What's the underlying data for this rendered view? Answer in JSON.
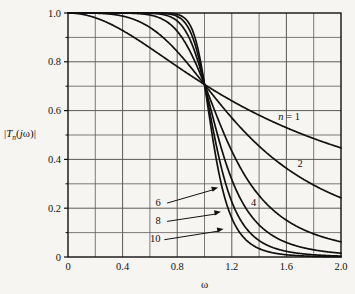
{
  "figure": {
    "background_color": "#f7f5f1",
    "ink_color": "#111111",
    "grid_color": "#5a5a5a",
    "axis_color": "#111111"
  },
  "labels": {
    "ylabel_prefix": "|",
    "ylabel_T": "T",
    "ylabel_n": "n",
    "ylabel_open": "(",
    "ylabel_j": "j",
    "ylabel_omega": "ω",
    "ylabel_close": ")|",
    "xlabel": "ω",
    "n_equals_one": "n = 1",
    "n_equals_one_italic": "n",
    "n_equals_one_rest": " = 1"
  },
  "chart_data": {
    "type": "line",
    "title": "",
    "subtitle": "",
    "xlabel": "ω",
    "ylabel": "|T_n(jω)|",
    "xlim": [
      0,
      2.0
    ],
    "ylim": [
      0,
      1.0
    ],
    "grid": true,
    "grid_x_major": [
      0,
      0.4,
      0.8,
      1.2,
      1.6,
      2.0
    ],
    "grid_x_minor": [
      0.2,
      0.6,
      1.0,
      1.4,
      1.8
    ],
    "grid_y_major": [
      0,
      0.2,
      0.4,
      0.6,
      0.8,
      1.0
    ],
    "grid_y_minor": [
      0.1,
      0.3,
      0.5,
      0.7,
      0.9
    ],
    "xticks": [
      0,
      0.4,
      0.8,
      1.2,
      1.6,
      2.0
    ],
    "xticklabels": [
      "0",
      "0.4",
      "0.8",
      "1.2",
      "1.6",
      "2.0"
    ],
    "yticks": [
      0,
      0.2,
      0.4,
      0.6,
      0.8,
      1.0
    ],
    "yticklabels": [
      "0",
      "0.2",
      "0.4",
      "0.6",
      "0.8",
      "1.0"
    ],
    "legend_position": "inline-annotations",
    "formula": "|T_n(jω)| = 1 / sqrt(1 + ω^(2n))",
    "crossing_point": [
      1.0,
      0.707
    ],
    "series": [
      {
        "name": "n = 1",
        "n": 1,
        "label": "n = 1",
        "label_x": 1.62,
        "label_y": 0.575,
        "annotation_style": "inline",
        "x": [
          0,
          0.1,
          0.2,
          0.3,
          0.4,
          0.5,
          0.6,
          0.7,
          0.8,
          0.9,
          1.0,
          1.1,
          1.2,
          1.3,
          1.4,
          1.5,
          1.6,
          1.7,
          1.8,
          1.9,
          2.0
        ],
        "values": [
          1.0,
          0.995,
          0.981,
          0.958,
          0.928,
          0.894,
          0.857,
          0.819,
          0.781,
          0.743,
          0.707,
          0.673,
          0.64,
          0.61,
          0.581,
          0.555,
          0.53,
          0.507,
          0.486,
          0.466,
          0.447
        ]
      },
      {
        "name": "2",
        "n": 2,
        "label": "2",
        "label_x": 1.7,
        "label_y": 0.385,
        "annotation_style": "inline",
        "x": [
          0,
          0.1,
          0.2,
          0.3,
          0.4,
          0.5,
          0.6,
          0.7,
          0.8,
          0.9,
          1.0,
          1.1,
          1.2,
          1.3,
          1.4,
          1.5,
          1.6,
          1.7,
          1.8,
          1.9,
          2.0
        ],
        "values": [
          1.0,
          1.0,
          0.999,
          0.996,
          0.987,
          0.97,
          0.941,
          0.899,
          0.843,
          0.779,
          0.707,
          0.637,
          0.571,
          0.511,
          0.459,
          0.413,
          0.372,
          0.337,
          0.306,
          0.279,
          0.254
        ]
      },
      {
        "name": "4",
        "n": 4,
        "label": "4",
        "label_x": 1.36,
        "label_y": 0.225,
        "annotation_style": "inline",
        "x": [
          0,
          0.1,
          0.2,
          0.3,
          0.4,
          0.5,
          0.6,
          0.7,
          0.8,
          0.9,
          1.0,
          1.1,
          1.2,
          1.3,
          1.4,
          1.5,
          1.6,
          1.7,
          1.8,
          1.9,
          2.0
        ],
        "values": [
          1.0,
          1.0,
          1.0,
          1.0,
          1.0,
          0.998,
          0.991,
          0.972,
          0.927,
          0.841,
          0.707,
          0.552,
          0.414,
          0.306,
          0.227,
          0.172,
          0.133,
          0.104,
          0.083,
          0.067,
          0.055
        ]
      },
      {
        "name": "6",
        "n": 6,
        "label": "6",
        "label_x": 0.66,
        "label_y": 0.225,
        "annotation_style": "leader-arrow",
        "arrow_to_x": 1.1,
        "arrow_to_y": 0.285,
        "x": [
          0,
          0.1,
          0.2,
          0.3,
          0.4,
          0.5,
          0.6,
          0.7,
          0.8,
          0.9,
          1.0,
          1.1,
          1.2,
          1.3,
          1.4,
          1.5,
          1.6,
          1.7,
          1.8,
          1.9,
          2.0
        ],
        "values": [
          1.0,
          1.0,
          1.0,
          1.0,
          1.0,
          1.0,
          0.999,
          0.994,
          0.97,
          0.88,
          0.707,
          0.483,
          0.3,
          0.181,
          0.111,
          0.07,
          0.045,
          0.03,
          0.021,
          0.015,
          0.011
        ]
      },
      {
        "name": "8",
        "n": 8,
        "label": "8",
        "label_x": 0.66,
        "label_y": 0.15,
        "annotation_style": "leader-arrow",
        "arrow_to_x": 1.12,
        "arrow_to_y": 0.185,
        "x": [
          0,
          0.1,
          0.2,
          0.3,
          0.4,
          0.5,
          0.6,
          0.7,
          0.8,
          0.9,
          1.0,
          1.1,
          1.2,
          1.3,
          1.4,
          1.5,
          1.6,
          1.7,
          1.8,
          1.9,
          2.0
        ],
        "values": [
          1.0,
          1.0,
          1.0,
          1.0,
          1.0,
          1.0,
          1.0,
          0.999,
          0.987,
          0.906,
          0.707,
          0.424,
          0.216,
          0.107,
          0.055,
          0.029,
          0.016,
          0.009,
          0.005,
          0.003,
          0.002
        ]
      },
      {
        "name": "10",
        "n": 10,
        "label": "10",
        "label_x": 0.64,
        "label_y": 0.075,
        "annotation_style": "leader-arrow",
        "arrow_to_x": 1.14,
        "arrow_to_y": 0.115,
        "x": [
          0,
          0.1,
          0.2,
          0.3,
          0.4,
          0.5,
          0.6,
          0.7,
          0.8,
          0.9,
          1.0,
          1.1,
          1.2,
          1.3,
          1.4,
          1.5,
          1.6,
          1.7,
          1.8,
          1.9,
          2.0
        ],
        "values": [
          1.0,
          1.0,
          1.0,
          1.0,
          1.0,
          1.0,
          1.0,
          1.0,
          0.995,
          0.925,
          0.707,
          0.371,
          0.155,
          0.062,
          0.026,
          0.011,
          0.005,
          0.002,
          0.001,
          0.001,
          0.0
        ]
      }
    ]
  }
}
